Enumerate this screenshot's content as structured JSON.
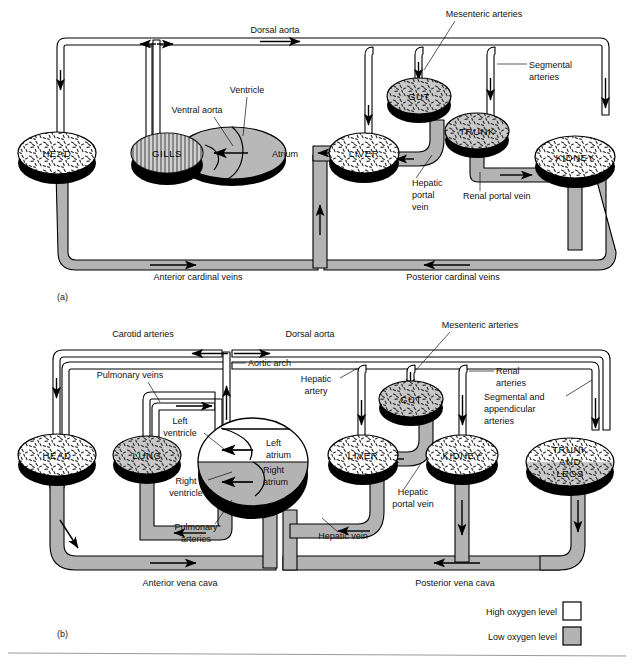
{
  "figure": {
    "panels": [
      {
        "id": "a",
        "label": "(a)",
        "caption": "Fish single circulation"
      },
      {
        "id": "b",
        "label": "(b)",
        "caption": "Amphibian double circulation"
      }
    ]
  },
  "colors": {
    "low_oxygen_fill": "#b3b3b3",
    "high_oxygen_fill": "#ffffff",
    "outline": "#000000",
    "organ_shadow": "#000000",
    "organ_top": "#e8e8e8",
    "rule": "#9a9a9a"
  },
  "legend": {
    "items": [
      {
        "label": "High oxygen level",
        "swatch": "#ffffff"
      },
      {
        "label": "Low oxygen level",
        "swatch": "#b3b3b3"
      }
    ]
  },
  "panel_a": {
    "panel_label": "(a)",
    "organs": [
      {
        "name": "HEAD",
        "lines": [
          "HEAD"
        ]
      },
      {
        "name": "GILLS",
        "lines": [
          "GILLS"
        ]
      },
      {
        "name": "LIVER",
        "lines": [
          "LIVER"
        ]
      },
      {
        "name": "GUT",
        "lines": [
          "GUT"
        ]
      },
      {
        "name": "TRUNK",
        "lines": [
          "TRUNK"
        ]
      },
      {
        "name": "KIDNEY",
        "lines": [
          "KIDNEY"
        ]
      }
    ],
    "heart": {
      "atrium_label": "Atrium",
      "ventricle_label": "Ventricle"
    },
    "vessels": [
      {
        "label": "Dorsal aorta",
        "oxygen": "high"
      },
      {
        "label": "Ventral aorta",
        "oxygen": "low"
      },
      {
        "label": "Mesenteric arteries",
        "oxygen": "high"
      },
      {
        "label": "Segmental arteries",
        "oxygen": "high"
      },
      {
        "label": "Hepatic portal vein",
        "oxygen": "low"
      },
      {
        "label": "Renal portal vein",
        "oxygen": "low"
      },
      {
        "label": "Anterior cardinal veins",
        "oxygen": "low"
      },
      {
        "label": "Posterior cardinal veins",
        "oxygen": "low"
      }
    ],
    "labels": {
      "dorsal_aorta": "Dorsal aorta",
      "ventral_aorta": "Ventral aorta",
      "ventricle": "Ventricle",
      "atrium": "Atrium",
      "mesenteric_arteries": "Mesenteric arteries",
      "segmental_arteries_l1": "Segmental",
      "segmental_arteries_l2": "arteries",
      "hepatic_portal_l1": "Hepatic",
      "hepatic_portal_l2": "portal",
      "hepatic_portal_l3": "vein",
      "renal_portal_vein": "Renal portal vein",
      "anterior_cardinal_veins": "Anterior cardinal veins",
      "posterior_cardinal_veins": "Posterior cardinal veins"
    }
  },
  "panel_b": {
    "panel_label": "(b)",
    "organs": [
      {
        "name": "HEAD",
        "lines": [
          "HEAD"
        ]
      },
      {
        "name": "LUNG",
        "lines": [
          "LUNG"
        ]
      },
      {
        "name": "LIVER",
        "lines": [
          "LIVER"
        ]
      },
      {
        "name": "GUT",
        "lines": [
          "GUT"
        ]
      },
      {
        "name": "KIDNEY",
        "lines": [
          "KIDNEY"
        ]
      },
      {
        "name": "TRUNK AND LEGS",
        "lines": [
          "TRUNK",
          "AND",
          "LEGS"
        ]
      }
    ],
    "heart": {
      "left_atrium_l1": "Left",
      "left_atrium_l2": "atrium",
      "right_atrium_l1": "Right",
      "right_atrium_l2": "atrium",
      "left_ventricle_l1": "Left",
      "left_ventricle_l2": "ventricle",
      "right_ventricle_l1": "Right",
      "right_ventricle_l2": "ventricle"
    },
    "labels": {
      "carotid_arteries": "Carotid arteries",
      "dorsal_aorta": "Dorsal aorta",
      "aortic_arch": "Aortic arch",
      "pulmonary_veins": "Pulmonary veins",
      "pulmonary_arteries_l1": "Pulmonary",
      "pulmonary_arteries_l2": "arteries",
      "hepatic_artery_l1": "Hepatic",
      "hepatic_artery_l2": "artery",
      "hepatic_vein": "Hepatic vein",
      "hepatic_portal_l1": "Hepatic",
      "hepatic_portal_l2": "portal vein",
      "mesenteric_arteries": "Mesenteric arteries",
      "renal_arteries_l1": "Renal",
      "renal_arteries_l2": "arteries",
      "segmental_l1": "Segmental and",
      "segmental_l2": "appendicular",
      "segmental_l3": "arteries",
      "anterior_vena_cava": "Anterior vena cava",
      "posterior_vena_cava": "Posterior vena cava"
    }
  }
}
